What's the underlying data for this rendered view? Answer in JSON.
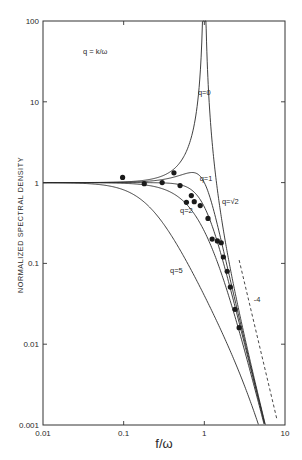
{
  "chart_data": {
    "type": "line",
    "title": "",
    "xlabel": "f/ω",
    "ylabel": "NORMALIZED SPECTRAL DENSITY",
    "xscale": "log",
    "yscale": "log",
    "xlim": [
      0.01,
      10
    ],
    "ylim": [
      0.001,
      100
    ],
    "grid": false,
    "x_ticks": [
      {
        "value": 0.01,
        "label": "0.01"
      },
      {
        "value": 0.1,
        "label": "0.1"
      },
      {
        "value": 1,
        "label": "1"
      },
      {
        "value": 10,
        "label": "10"
      }
    ],
    "y_ticks": [
      {
        "value": 100,
        "label": "100"
      },
      {
        "value": 10,
        "label": "10"
      },
      {
        "value": 1,
        "label": "1"
      },
      {
        "value": 0.1,
        "label": "0.1"
      },
      {
        "value": 0.01,
        "label": "0.01"
      },
      {
        "value": 0.001,
        "label": "0.001"
      }
    ],
    "parameter_annotation": "q = k/ω",
    "model": "S = 1 / ((1 - (f/ω)^2)^2 + q^2 (f/ω)^2)",
    "series": [
      {
        "name": "q=0",
        "label": "q=0",
        "q": 0,
        "label_at": {
          "x": 1.0,
          "y": 12
        }
      },
      {
        "name": "q=1",
        "label": "q=1",
        "q": 1,
        "label_at": {
          "x": 1.05,
          "y": 1.05
        }
      },
      {
        "name": "q=√2",
        "label": "q=√2",
        "q": 1.4142,
        "label_at": {
          "x": 2.1,
          "y": 0.55
        }
      },
      {
        "name": "q=2",
        "label": "q=2",
        "q": 2,
        "label_at": {
          "x": 0.6,
          "y": 0.42
        }
      },
      {
        "name": "q=5",
        "label": "q=5",
        "q": 5,
        "label_at": {
          "x": 0.45,
          "y": 0.075
        }
      }
    ],
    "observed_points": {
      "name": "measured",
      "x": [
        0.097,
        0.18,
        0.3,
        0.42,
        0.5,
        0.6,
        0.69,
        0.75,
        0.89,
        1.11,
        1.25,
        1.45,
        1.62,
        1.72,
        1.92,
        2.1,
        2.4,
        2.7
      ],
      "y": [
        1.16,
        0.97,
        1.0,
        1.32,
        0.92,
        0.57,
        0.69,
        0.58,
        0.52,
        0.36,
        0.2,
        0.19,
        0.18,
        0.12,
        0.08,
        0.051,
        0.027,
        0.016
      ]
    },
    "reference_slope": {
      "label": "-4",
      "slope": -4,
      "style": "dashed",
      "from": {
        "x": 2.7,
        "y": 0.11
      },
      "to": {
        "x": 7.9,
        "y": 0.0012
      },
      "label_at": {
        "x": 4.1,
        "y": 0.033
      }
    }
  }
}
